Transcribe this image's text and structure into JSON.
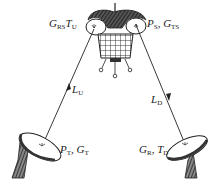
{
  "diagram": {
    "type": "satellite-link-budget",
    "satellite": {
      "label_left": {
        "main1": "G",
        "sub1": "RS",
        "main2": "T",
        "sub2": "U"
      },
      "label_right": {
        "main1": "P",
        "sub1": "S",
        "sep": ", ",
        "main2": "G",
        "sub2": "TS"
      }
    },
    "uplink": {
      "label": {
        "main": "L",
        "sub": "U"
      },
      "direction": "up"
    },
    "downlink": {
      "label": {
        "main": "L",
        "sub": "D"
      },
      "direction": "down"
    },
    "transmit_station": {
      "label": {
        "main1": "P",
        "sub1": "T",
        "sep": ", ",
        "main2": "G",
        "sub2": "T"
      }
    },
    "receive_station": {
      "label": {
        "main1": "G",
        "sub1": "R",
        "sep": ", ",
        "main2": "T",
        "sub2": "D"
      }
    },
    "colors": {
      "line": "#222222",
      "background": "#ffffff"
    }
  }
}
